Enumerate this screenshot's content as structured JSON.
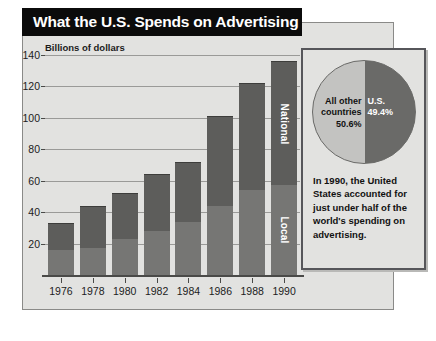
{
  "title": "What the U.S. Spends on Advertising",
  "axis_caption": "Billions of dollars",
  "colors": {
    "panel_bg": "#e2e2e0",
    "bar_local": "#767674",
    "bar_national": "#5d5d5b",
    "pie_us": "#6a6a68",
    "pie_other": "#c3c3c1",
    "title_bg": "#0b0b0b",
    "gridline": "#9a9a98"
  },
  "bar_labels": {
    "national": "National",
    "local": "Local"
  },
  "inset": {
    "label_other": "All other\ncountries\n50.6%",
    "label_other_line1": "All other",
    "label_other_line2": "countries",
    "label_other_line3": "50.6%",
    "label_us_line1": "U.S.",
    "label_us_line2": "49.4%",
    "caption": "In 1990, the United States accounted for just under half of the world's spending on advertising."
  },
  "chart_data": [
    {
      "type": "bar",
      "title": "What the U.S. Spends on Advertising",
      "subtitle": "Billions of dollars",
      "xlabel": "",
      "ylabel": "Billions of dollars",
      "stacked": true,
      "grid": true,
      "legend_position": "in-bar",
      "ylim": [
        0,
        140
      ],
      "yticks": [
        20,
        40,
        60,
        80,
        100,
        120,
        140
      ],
      "categories": [
        "1976",
        "1978",
        "1980",
        "1982",
        "1984",
        "1986",
        "1988",
        "1990"
      ],
      "series": [
        {
          "name": "Local",
          "values": [
            16,
            17,
            23,
            28,
            34,
            44,
            54,
            57
          ]
        },
        {
          "name": "National",
          "values": [
            17,
            27,
            29,
            36,
            38,
            57,
            68,
            79
          ]
        }
      ],
      "totals": [
        33,
        44,
        52,
        64,
        72,
        101,
        122,
        136
      ]
    },
    {
      "type": "pie",
      "title": "World advertising spending, 1990",
      "labels": [
        "All other countries",
        "U.S."
      ],
      "values": [
        50.6,
        49.4
      ],
      "unit": "%",
      "legend_position": "inside"
    }
  ]
}
